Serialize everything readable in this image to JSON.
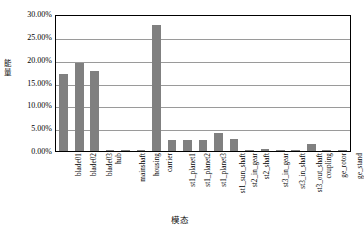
{
  "chart_data": {
    "type": "bar",
    "title": "",
    "xlabel": "模态",
    "ylabel": "能量",
    "ylim": [
      0,
      0.3
    ],
    "ytick_labels": [
      "30.00%",
      "25.00%",
      "20.00%",
      "15.00%",
      "10.00%",
      "5.00%",
      "0.00%"
    ],
    "ytick_values": [
      30.0,
      25.0,
      20.0,
      15.0,
      10.0,
      5.0,
      0.0
    ],
    "grid": true,
    "legend": false,
    "bar_color": "#808080",
    "axis_color": "#000000",
    "gridline_color": "#9a9a9a",
    "categories": [
      "blade01",
      "blade02",
      "blade03",
      "hub",
      "mainshaft",
      "housing",
      "carrier",
      "st1_planet1",
      "st1_planet2",
      "st1_planet3",
      "st1_sun_shaft",
      "st2_in_gear",
      "st2_shaft",
      "st3_in_gear",
      "st3_in_shaft",
      "st3_out_shaft",
      "coupling",
      "ge_rotor",
      "ge_stand"
    ],
    "values": [
      16.8,
      19.2,
      17.6,
      0.1,
      0.3,
      0.3,
      27.5,
      2.4,
      2.4,
      2.4,
      3.9,
      2.7,
      0.3,
      0.5,
      0.1,
      0.1,
      1.6,
      0.05,
      0.05
    ],
    "value_unit": "%"
  }
}
